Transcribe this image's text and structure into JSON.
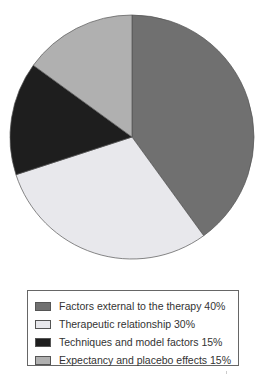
{
  "chart_data": {
    "type": "pie",
    "title": "",
    "categories": [
      "Factors external to the therapy",
      "Therapeutic relationship",
      "Techniques and model factors",
      "Expectancy and placebo effects"
    ],
    "values": [
      40,
      30,
      15,
      15
    ],
    "colors": [
      "#707070",
      "#e8e8ec",
      "#1e1e1e",
      "#b0b0b0"
    ],
    "start_angle_deg": 0,
    "direction": "clockwise",
    "legend_position": "bottom"
  },
  "legend": {
    "items": [
      {
        "label": "Factors external to the therapy 40%",
        "color": "#707070"
      },
      {
        "label": "Therapeutic relationship 30%",
        "color": "#e8e8ec"
      },
      {
        "label": "Techniques and model factors 15%",
        "color": "#1e1e1e"
      },
      {
        "label": "Expectancy and placebo effects 15%",
        "color": "#b0b0b0"
      }
    ]
  }
}
